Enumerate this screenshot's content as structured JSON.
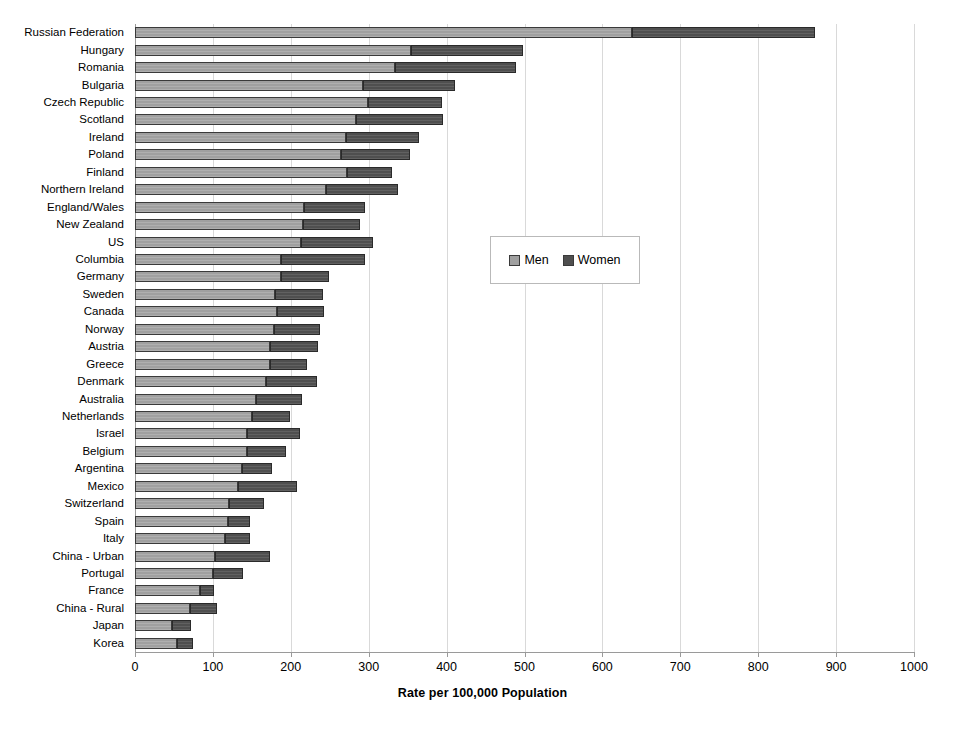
{
  "chart_data": {
    "type": "bar",
    "orientation": "horizontal",
    "stacked": true,
    "title": "",
    "xlabel": "Rate per 100,000 Population",
    "ylabel": "",
    "xlim": [
      0,
      1000
    ],
    "xticks": [
      0,
      100,
      200,
      300,
      400,
      500,
      600,
      700,
      800,
      900,
      1000
    ],
    "grid": true,
    "legend": [
      "Men",
      "Women"
    ],
    "legend_position": "center-right inside plot",
    "colors": {
      "men": "#a0a0a0",
      "women": "#4f4f4f",
      "axis": "#9a9a9a",
      "grid": "#d9d9d9"
    },
    "categories": [
      "Korea",
      "Japan",
      "China - Rural",
      "France",
      "Portugal",
      "China - Urban",
      "Italy",
      "Spain",
      "Switzerland",
      "Mexico",
      "Argentina",
      "Belgium",
      "Israel",
      "Netherlands",
      "Australia",
      "Denmark",
      "Greece",
      "Austria",
      "Norway",
      "Canada",
      "Sweden",
      "Germany",
      "Columbia",
      "US",
      "New Zealand",
      "England/Wales",
      "Northern Ireland",
      "Finland",
      "Poland",
      "Ireland",
      "Scotland",
      "Czech Republic",
      "Bulgaria",
      "Romania",
      "Hungary",
      "Russian Federation"
    ],
    "series": [
      {
        "name": "Men",
        "values": [
          54,
          48,
          71,
          83,
          100,
          103,
          116,
          120,
          121,
          132,
          137,
          144,
          144,
          150,
          155,
          168,
          173,
          173,
          178,
          182,
          180,
          188,
          188,
          213,
          216,
          217,
          245,
          272,
          265,
          271,
          284,
          299,
          293,
          334,
          354,
          638
        ]
      },
      {
        "name": "Women",
        "values": [
          21,
          24,
          34,
          19,
          39,
          70,
          32,
          27,
          44,
          76,
          39,
          50,
          68,
          49,
          59,
          66,
          48,
          62,
          60,
          60,
          61,
          61,
          107,
          93,
          73,
          78,
          93,
          58,
          88,
          94,
          111,
          95,
          118,
          155,
          144,
          235
        ]
      }
    ],
    "totals": [
      75,
      72,
      105,
      102,
      139,
      173,
      148,
      147,
      165,
      208,
      176,
      194,
      212,
      199,
      214,
      234,
      221,
      235,
      238,
      242,
      241,
      249,
      295,
      306,
      289,
      295,
      338,
      330,
      353,
      365,
      395,
      394,
      411,
      489,
      498,
      873
    ]
  }
}
